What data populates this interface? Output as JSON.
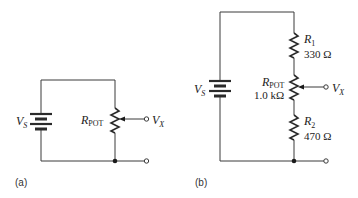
{
  "figure": {
    "panels": [
      {
        "id": "a",
        "caption": "(a)",
        "source": {
          "symbol": "V",
          "subscript": "S"
        },
        "potentiometer": {
          "symbol": "R",
          "subscript": "POT"
        },
        "output": {
          "symbol": "V",
          "subscript": "X"
        }
      },
      {
        "id": "b",
        "caption": "(b)",
        "source": {
          "symbol": "V",
          "subscript": "S"
        },
        "r1": {
          "symbol": "R",
          "subscript": "1",
          "value": "330 Ω"
        },
        "potentiometer": {
          "symbol": "R",
          "subscript": "POT",
          "value": "1.0 kΩ"
        },
        "r2": {
          "symbol": "R",
          "subscript": "2",
          "value": "470 Ω"
        },
        "output": {
          "symbol": "V",
          "subscript": "X"
        }
      }
    ]
  }
}
